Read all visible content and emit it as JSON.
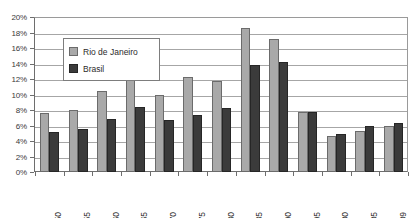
{
  "chart_data": {
    "type": "bar",
    "title": "",
    "subtitle": "",
    "xlabel": "",
    "ylabel": "",
    "categories": [
      "1950",
      "1955",
      "1960",
      "1965",
      "1970",
      "1975",
      "1980",
      "1985",
      "1990",
      "1995",
      "2000",
      "2005",
      "2009"
    ],
    "series": [
      {
        "name": "Rio de Janeiro",
        "color": "#a9a9a9",
        "values": [
          7.6,
          8.0,
          10.4,
          12.2,
          9.9,
          12.2,
          11.7,
          18.6,
          17.1,
          7.7,
          4.6,
          5.3,
          5.9
        ]
      },
      {
        "name": "Brasil",
        "color": "#3b3b3b",
        "values": [
          5.1,
          5.6,
          6.8,
          8.4,
          6.7,
          7.4,
          8.2,
          13.8,
          14.2,
          7.8,
          4.9,
          6.0,
          6.3
        ]
      }
    ],
    "ylim": [
      0,
      20
    ],
    "ytick_values": [
      0,
      2,
      4,
      6,
      8,
      10,
      12,
      14,
      16,
      18,
      20
    ],
    "ytick_labels": [
      "0%",
      "2%",
      "4%",
      "6%",
      "8%",
      "10%",
      "12%",
      "14%",
      "16%",
      "18%",
      "20%"
    ],
    "grid": true,
    "grid_axis": "y",
    "legend_position": "upper-left-inside",
    "legend_entries": [
      "Rio de Janeiro",
      "Brasil"
    ],
    "plot_border_color": "#6e6e6e",
    "gridline_color": "#a6a6a6",
    "background_color": "#ffffff"
  }
}
